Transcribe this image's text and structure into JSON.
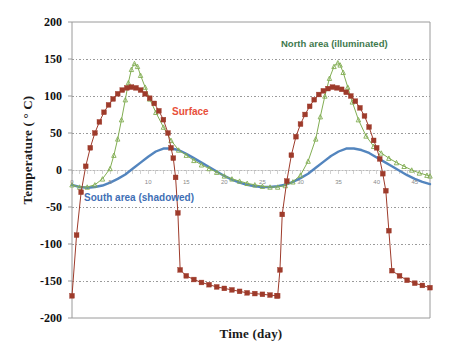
{
  "chart_data": {
    "type": "line",
    "title": "",
    "xlabel": "Time (day)",
    "ylabel": "Temperature ( ° C)",
    "xlim": [
      0,
      47
    ],
    "ylim": [
      -200,
      200
    ],
    "ytick_labels": [
      "200",
      "150",
      "100",
      "50",
      "0",
      "-50",
      "-100",
      "-150",
      "-200"
    ],
    "ytick_values": [
      200,
      150,
      100,
      50,
      0,
      -50,
      -100,
      -150,
      -200
    ],
    "xtick_labels": [
      "0",
      "5",
      "10",
      "15",
      "20",
      "25",
      "30",
      "35",
      "40",
      "45"
    ],
    "xtick_values": [
      0,
      5,
      10,
      15,
      20,
      25,
      30,
      35,
      40,
      45
    ],
    "grid": "horizontal-dotted",
    "legend_position": "inline-annotations",
    "series": [
      {
        "name": "Surface",
        "color": "#9E3B2B",
        "label_color": "#e8503a",
        "marker": "square",
        "x": [
          0,
          0.6,
          1.2,
          1.8,
          2.4,
          3.0,
          3.6,
          4.2,
          4.8,
          5.4,
          6.0,
          6.6,
          7.2,
          7.8,
          8.4,
          9.0,
          9.6,
          10.2,
          10.8,
          11.4,
          12.0,
          12.6,
          13.0,
          13.3,
          13.6,
          13.9,
          14.2,
          15,
          16,
          17,
          18,
          19,
          20,
          21,
          22,
          23,
          24,
          25,
          26,
          26.9,
          27,
          27.3,
          27.6,
          28.2,
          28.8,
          29.4,
          30.0,
          30.6,
          31.2,
          31.8,
          32.4,
          33.0,
          33.6,
          34.2,
          34.8,
          35.4,
          36.0,
          36.6,
          37.2,
          37.8,
          38.4,
          39.0,
          39.6,
          40.0,
          40.4,
          40.8,
          41.2,
          41.6,
          42.0,
          43,
          44,
          45,
          46,
          47
        ],
        "y": [
          -170,
          -88,
          -30,
          5,
          30,
          50,
          65,
          78,
          88,
          96,
          103,
          108,
          111,
          112,
          111,
          108,
          103,
          97,
          90,
          80,
          68,
          50,
          30,
          16,
          -10,
          -58,
          -135,
          -143,
          -148,
          -152,
          -155,
          -158,
          -160,
          -162,
          -164,
          -166,
          -167,
          -168,
          -169,
          -170,
          -170,
          -135,
          -60,
          -15,
          20,
          45,
          62,
          75,
          86,
          95,
          102,
          107,
          110,
          112,
          111,
          109,
          105,
          100,
          93,
          84,
          73,
          58,
          40,
          30,
          15,
          -5,
          -28,
          -82,
          -136,
          -143,
          -149,
          -153,
          -156,
          -159
        ]
      },
      {
        "name": "North area (illuminated)",
        "color": "#82AE53",
        "label_color": "#3f7a4e",
        "marker": "triangle",
        "x": [
          0,
          1,
          2,
          3,
          4,
          5,
          5.5,
          6,
          6.5,
          7,
          7.4,
          7.8,
          8.2,
          8.6,
          9,
          9.6,
          10.2,
          11,
          12,
          13,
          14,
          15,
          16,
          17,
          18,
          19,
          20,
          21,
          22,
          23,
          24,
          25,
          26,
          27,
          28,
          29,
          30,
          31,
          32,
          32.6,
          33.2,
          33.8,
          34.4,
          34.9,
          35.2,
          35.6,
          36.2,
          36.8,
          37.6,
          38.6,
          39.6,
          40.6,
          41.6,
          42.6,
          43.6,
          44.6,
          45.6,
          46.6,
          47
        ],
        "y": [
          -20,
          -23,
          -23,
          -20,
          -12,
          2,
          20,
          42,
          68,
          95,
          118,
          136,
          144,
          140,
          128,
          112,
          96,
          78,
          58,
          40,
          27,
          20,
          13,
          7,
          2,
          -3,
          -8,
          -12,
          -15,
          -18,
          -20,
          -22,
          -23,
          -23,
          -21,
          -16,
          -7,
          12,
          42,
          72,
          100,
          124,
          140,
          145,
          142,
          132,
          112,
          92,
          68,
          46,
          32,
          23,
          16,
          10,
          5,
          0,
          -4,
          -7,
          -8
        ]
      },
      {
        "name": "South area (shadowed)",
        "color": "#4A7EBB",
        "label_color": "#3f6fb5",
        "marker": "none",
        "x": [
          0,
          1,
          2,
          3,
          4,
          5,
          6,
          7,
          8,
          9,
          10,
          11,
          12,
          13,
          14,
          15,
          16,
          17,
          18,
          19,
          20,
          21,
          22,
          23,
          24,
          25,
          26,
          27,
          28,
          29,
          30,
          31,
          32,
          33,
          34,
          35,
          36,
          37,
          38,
          39,
          40,
          41,
          42,
          43,
          44,
          45,
          46,
          47
        ],
        "y": [
          -20,
          -23,
          -24,
          -23,
          -21,
          -17,
          -12,
          -6,
          2,
          10,
          18,
          25,
          29,
          29,
          27,
          22,
          16,
          10,
          4,
          -2,
          -8,
          -13,
          -17,
          -20,
          -22,
          -23,
          -23,
          -22,
          -20,
          -16,
          -11,
          -5,
          3,
          11,
          19,
          25,
          29,
          29,
          27,
          23,
          17,
          11,
          5,
          -1,
          -7,
          -12,
          -16,
          -19
        ]
      }
    ],
    "annotations": [
      {
        "text": "North area (illuminated)",
        "color": "#3f7a4e"
      },
      {
        "text": "Surface",
        "color": "#e8503a"
      },
      {
        "text": "South area (shadowed)",
        "color": "#3f6fb5"
      }
    ]
  }
}
